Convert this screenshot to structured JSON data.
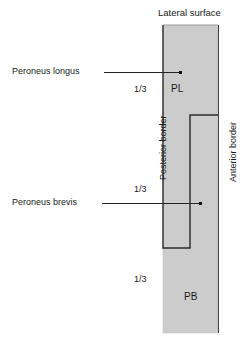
{
  "figure": {
    "title_top": "Lateral surface",
    "left_border_label": "Posterior border",
    "right_border_label": "Anterior border",
    "thirds": [
      "1/3",
      "1/3",
      "1/3"
    ],
    "muscle_abbreviations": {
      "peroneus_longus": "PL",
      "peroneus_brevis": "PB"
    },
    "callouts": [
      {
        "label": "Peroneus longus"
      },
      {
        "label": "Peroneus brevis"
      }
    ],
    "colors": {
      "bone_fill": "#cccccc",
      "outline": "#2a2a2a",
      "leader": "#222222",
      "text": "#1a1a1a"
    }
  }
}
